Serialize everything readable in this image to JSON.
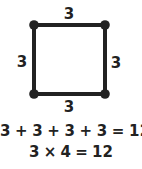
{
  "diagram": {
    "shape": "square",
    "side_length": "3",
    "edges": {
      "top": "3",
      "left": "3",
      "right": "3",
      "bottom": "3"
    },
    "vertices": 4,
    "colors": {
      "stroke": "#222222",
      "text": "#222222",
      "background": "#ffffff"
    }
  },
  "equations": {
    "sum": "3 + 3 + 3 + 3 = 12",
    "product": "3 × 4 = 12"
  }
}
